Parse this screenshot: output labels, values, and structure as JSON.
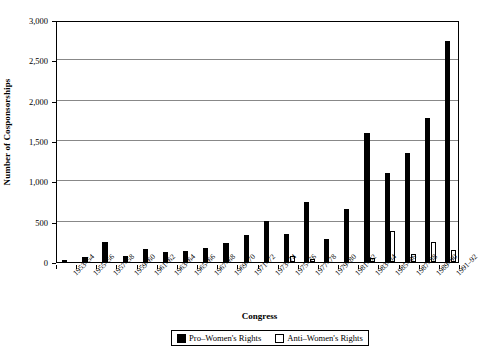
{
  "chart_data": {
    "type": "bar",
    "title": "",
    "xlabel": "Congress",
    "ylabel": "Number of Cosponsorships",
    "ylim": [
      0,
      3000
    ],
    "yticks": [
      0,
      500,
      1000,
      1500,
      2000,
      2500,
      3000
    ],
    "ytick_labels": [
      "0",
      "500",
      "1,000",
      "1,500",
      "2,000",
      "2,500",
      "3,000"
    ],
    "grid": "horizontal",
    "legend_position": "bottom-center",
    "categories": [
      "1953-54",
      "1955-56",
      "1957-58",
      "1959-60",
      "1961-62",
      "1963-64",
      "1965-66",
      "1967-68",
      "1969-70",
      "1971-72",
      "1973-74",
      "1975-76",
      "1977-78",
      "1979-80",
      "1981-82",
      "1983-84",
      "1985-86",
      "1987-88",
      "1989-90",
      "1991-92"
    ],
    "series": [
      {
        "name": "Pro-Women's Rights",
        "color": "#000000",
        "values": [
          30,
          65,
          250,
          80,
          160,
          130,
          135,
          170,
          235,
          330,
          510,
          350,
          740,
          290,
          660,
          1600,
          1100,
          1350,
          1780,
          2740
        ]
      },
      {
        "name": "Anti-Women's Rights",
        "color": "#ffffff",
        "values": [
          0,
          0,
          0,
          0,
          0,
          0,
          0,
          0,
          0,
          0,
          0,
          75,
          40,
          0,
          0,
          55,
          390,
          100,
          250,
          155
        ]
      }
    ],
    "legend": [
      {
        "label": "Pro–Women's Rights",
        "swatch": "filled-square"
      },
      {
        "label": "Anti–Women's Rights",
        "swatch": "hollow-square"
      }
    ]
  }
}
